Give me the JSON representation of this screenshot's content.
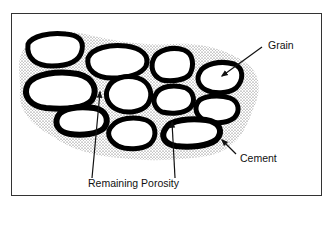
{
  "figure": {
    "type": "cemented sandstone cross-section",
    "labels": {
      "grain": "Grain",
      "cement": "Cement",
      "porosity": "Remaining Porosity"
    },
    "components": [
      "grains",
      "cement rims",
      "stippled remaining pore space"
    ],
    "colors": {
      "grain_fill": "#ffffff",
      "cement": "#000000",
      "pore_stipple": "#555555",
      "frame": "#333333"
    }
  }
}
